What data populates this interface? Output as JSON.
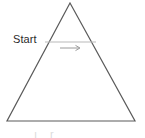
{
  "canvas": {
    "width": 145,
    "height": 138,
    "background_color": "#ffffff"
  },
  "diagram": {
    "kind": "geometry-figure",
    "shape_name": "triangle",
    "stroke_color": "#5a5a5a",
    "stroke_width": 1.2,
    "vertices": {
      "apex": {
        "x": 70,
        "y": 3
      },
      "base_left": {
        "x": 7,
        "y": 121
      },
      "base_right": {
        "x": 135,
        "y": 121
      }
    }
  },
  "measurement_line": {
    "color": "#b9b9b9",
    "stroke_width": 1,
    "x1": 45,
    "y1": 42,
    "x2": 96,
    "y2": 42
  },
  "direction_arrow": {
    "color": "#9a9a9a",
    "stroke_width": 1,
    "x1": 60,
    "y1": 48,
    "x2": 80,
    "y2": 48,
    "points": "right"
  },
  "labels": {
    "start": "Start",
    "bottom_cropped": "ı r"
  }
}
